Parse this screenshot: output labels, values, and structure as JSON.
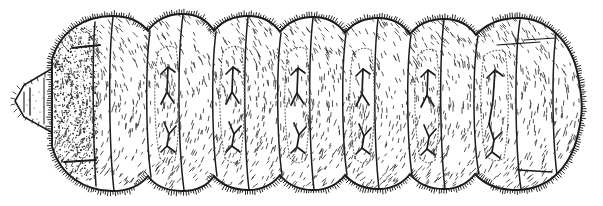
{
  "figure": {
    "view": "dorsal",
    "style": "pen-and-ink scientific line drawing",
    "background_color": "#ffffff",
    "ink_color": "#1a1a1a",
    "stipple_color": "#2b2b2b",
    "dotted_margin_color": "#6b6b6b",
    "canvas": {
      "width": 603,
      "height": 206
    },
    "caption": ""
  },
  "body": {
    "orientation": "head-left, abdomen-right",
    "outline_points": "M 52 62 L 52 60 C 60 30 86 16 112 16 C 130 16 141 22 148 31 C 155 20 168 14 182 14 C 197 14 208 21 214 31 C 222 21 234 16 248 16 C 262 16 273 22 280 32 C 288 22 300 17 313 17 C 327 17 338 23 345 33 C 353 23 365 18 378 18 C 392 18 403 24 410 34 C 418 24 430 19 444 19 C 458 19 469 25 476 35 C 486 24 500 18 518 18 C 548 18 572 42 578 76 C 583 103 583 112 578 134 C 570 170 546 190 516 190 C 498 190 484 184 475 174 C 468 183 457 189 444 189 C 430 189 418 184 410 174 C 403 183 392 189 378 189 C 365 189 353 184 345 175 C 338 184 327 190 313 190 C 300 190 288 185 280 175 C 273 184 262 190 248 190 C 234 190 222 185 214 176 C 208 185 197 191 182 191 C 168 191 155 186 148 176 C 141 185 130 191 112 191 C 86 191 60 176 52 146 Z",
    "head_projection_points": "M 52 70 L 22 86 L 14 100 L 22 116 L 52 134",
    "segment_count": 13,
    "segment_divider_x": [
      96,
      112,
      152,
      183,
      216,
      248,
      281,
      313,
      346,
      378,
      411,
      444,
      478,
      520,
      556
    ],
    "y_marking_segments": [
      4,
      5,
      6,
      7,
      8,
      9,
      10
    ],
    "setae_description": "short spiky setae fringing the dorsal, ventral and posterior margins",
    "texture_description": "fine dash hatching over each tergite; dense stippling on the first segment"
  },
  "labels": {
    "head": "head",
    "thorax": "thoracic segments",
    "abdomen": "abdominal segments",
    "anal_plate": "terminal segment"
  }
}
